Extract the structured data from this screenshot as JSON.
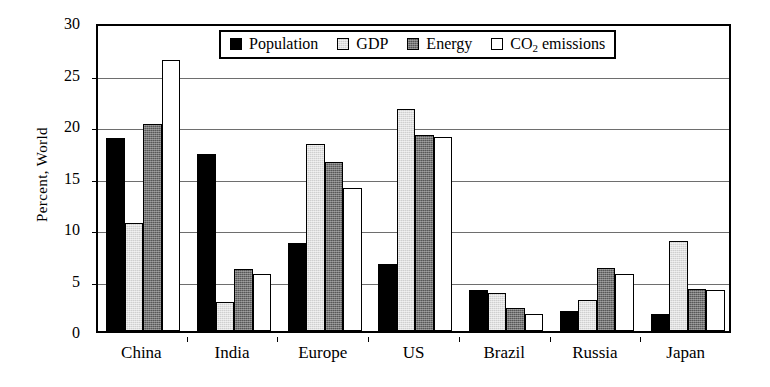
{
  "chart_data": {
    "type": "bar",
    "title": "",
    "subtitle": "",
    "xlabel": "",
    "ylabel": "Percent, World",
    "ylim": [
      0,
      30
    ],
    "yticks": [
      0,
      5,
      10,
      15,
      20,
      25,
      30
    ],
    "ytick_labels": [
      "0",
      "5",
      "10",
      "15",
      "20",
      "25",
      "30"
    ],
    "grid": true,
    "grid_axis": "y",
    "legend_position": "top-center",
    "categories": [
      "China",
      "India",
      "Europe",
      "US",
      "Brazil",
      "Russia",
      "Japan"
    ],
    "series": [
      {
        "name": "Population",
        "color": "#000000",
        "swatch": "solid-black",
        "values": [
          18.7,
          17.2,
          8.5,
          6.5,
          4.0,
          1.9,
          1.7
        ]
      },
      {
        "name": "GDP",
        "color": "#cfcfcf",
        "swatch": "light-gray",
        "values": [
          10.5,
          2.8,
          18.2,
          21.6,
          3.7,
          3.0,
          8.7
        ]
      },
      {
        "name": "Energy",
        "color": "#575757",
        "swatch": "dark-gray",
        "values": [
          20.1,
          6.0,
          16.4,
          19.0,
          2.2,
          6.1,
          4.1
        ]
      },
      {
        "name": "CO2 emissions",
        "color": "#ffffff",
        "swatch": "white",
        "values": [
          26.3,
          5.5,
          13.9,
          18.8,
          1.7,
          5.5,
          4.0
        ]
      }
    ]
  },
  "legend": {
    "entries": [
      {
        "label": "Population",
        "label_main": "Population",
        "label_sub": "",
        "label_tail": ""
      },
      {
        "label": "GDP",
        "label_main": "GDP",
        "label_sub": "",
        "label_tail": ""
      },
      {
        "label": "Energy",
        "label_main": "Energy",
        "label_sub": "",
        "label_tail": ""
      },
      {
        "label": "CO2 emissions",
        "label_main": "CO",
        "label_sub": "2",
        "label_tail": " emissions"
      }
    ]
  },
  "axes": {
    "y_title": "Percent, World"
  },
  "colors": {
    "population": "#000000",
    "gdp": "#cfcfcf",
    "energy": "#575757",
    "co2": "#ffffff",
    "frame": "#000000",
    "gridline": "#6e6e6e"
  }
}
